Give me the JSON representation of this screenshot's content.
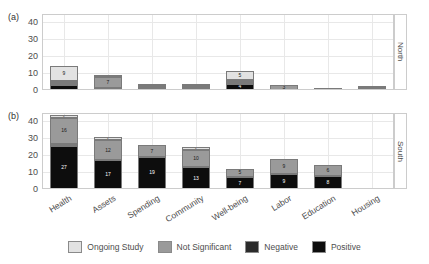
{
  "chart_data": {
    "type": "bar",
    "subtype": "stacked-bar-faceted",
    "title": "",
    "xlabel": "",
    "ylabel": "",
    "ylim": [
      0,
      45
    ],
    "yticks": [
      0,
      10,
      20,
      30,
      40
    ],
    "grid": true,
    "legend_position": "bottom",
    "categories": [
      "Health",
      "Assets",
      "Spending",
      "Community",
      "Well-being",
      "Labor",
      "Education",
      "Housing"
    ],
    "series": [
      {
        "name": "Positive",
        "color": "#0d0d0d"
      },
      {
        "name": "Negative",
        "color": "#2b2b2b"
      },
      {
        "name": "Not Significant",
        "color": "#9a9a9a"
      },
      {
        "name": "Ongoing Study",
        "color": "#e2e2e2"
      }
    ],
    "panels": [
      {
        "tag": "(a)",
        "facet": "North",
        "data": {
          "Positive": [
            3,
            1,
            1,
            1,
            4,
            0,
            0,
            1
          ],
          "Negative": [
            1,
            0,
            0,
            0,
            1,
            0,
            0,
            0
          ],
          "Not Significant": [
            1,
            7,
            1,
            1,
            1,
            3,
            0,
            0
          ],
          "Ongoing Study": [
            9,
            1,
            1,
            1,
            5,
            0,
            1,
            1
          ]
        },
        "labels": {
          "Positive": [
            "",
            "",
            "",
            "",
            "4",
            "",
            "",
            "2"
          ],
          "Negative": [
            "2",
            "",
            "2",
            "2",
            "2",
            "",
            "",
            ""
          ],
          "Not Significant": [
            "",
            "7",
            "",
            "",
            "",
            "3",
            "",
            ""
          ],
          "Ongoing Study": [
            "9",
            "",
            "",
            "",
            "5",
            "",
            "1",
            ""
          ]
        },
        "totals": [
          14,
          9,
          3,
          3,
          11,
          3,
          2,
          2
        ]
      },
      {
        "tag": "(b)",
        "facet": "South",
        "data": {
          "Positive": [
            27,
            17,
            19,
            13,
            7,
            9,
            8,
            0
          ],
          "Negative": [
            1,
            0,
            0,
            0,
            0,
            0,
            0,
            0
          ],
          "Not Significant": [
            16,
            12,
            7,
            10,
            5,
            9,
            6,
            0
          ],
          "Ongoing Study": [
            2,
            2,
            0,
            2,
            0,
            0,
            0,
            0
          ]
        },
        "labels": {
          "Positive": [
            "27",
            "17",
            "19",
            "13",
            "7",
            "9",
            "8",
            ""
          ],
          "Negative": [
            "",
            "",
            "",
            "",
            "",
            "",
            "",
            ""
          ],
          "Not Significant": [
            "16",
            "12",
            "7",
            "10",
            "5",
            "9",
            "6",
            ""
          ],
          "Ongoing Study": [
            "2",
            "2",
            "",
            "2",
            "",
            "",
            "",
            ""
          ]
        },
        "totals": [
          44,
          31,
          26,
          25,
          12,
          18,
          14,
          0
        ]
      }
    ]
  },
  "axis": {
    "tick_labels": [
      "40",
      "30",
      "20",
      "10",
      "0"
    ]
  },
  "panel_tags": {
    "top": "(a)",
    "bottom": "(b)"
  },
  "facets": {
    "top": "North",
    "bottom": "South"
  },
  "legend": {
    "items": [
      {
        "label": "Ongoing Study",
        "color": "#e2e2e2"
      },
      {
        "label": "Not Significant",
        "color": "#9a9a9a"
      },
      {
        "label": "Negative",
        "color": "#2b2b2b"
      },
      {
        "label": "Positive",
        "color": "#0d0d0d"
      }
    ]
  }
}
